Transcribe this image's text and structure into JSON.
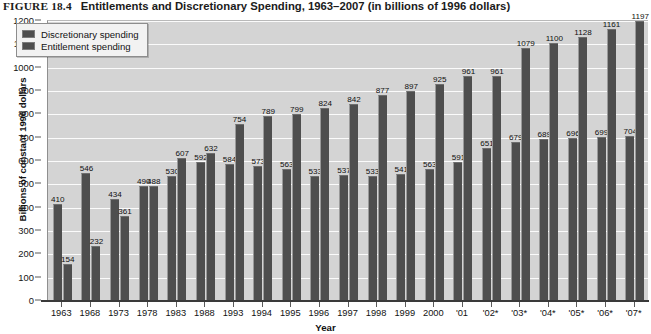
{
  "caption": {
    "figure_number": "FIGURE 18.4",
    "figure_title": "Entitlements and Discretionary Spending, 1963–2007 (in billions of 1996 dollars)"
  },
  "colors": {
    "plot_background": "#d4d4d4",
    "gridline": "#fbfbfb",
    "bar_fill": "#4e4e4e",
    "axis": "#3a3a3a",
    "legend_background": "#f2f2f2"
  },
  "chart_data": {
    "type": "bar",
    "title": "Entitlements and Discretionary Spending, 1963–2007 (in billions of 1996 dollars)",
    "xlabel": "Year",
    "ylabel": "Billions of constant 1996 dollars",
    "ylim": [
      0,
      1200
    ],
    "ytick_step": 100,
    "yticks": [
      0,
      100,
      200,
      300,
      400,
      500,
      600,
      700,
      800,
      900,
      1000,
      1100,
      1200
    ],
    "grid": true,
    "legend_position": "top-left",
    "categories": [
      "1963",
      "1968",
      "1973",
      "1978",
      "1983",
      "1988",
      "1993",
      "1994",
      "1995",
      "1996",
      "1997",
      "1998",
      "1999",
      "2000",
      "'01",
      "'02*",
      "'03*",
      "'04*",
      "'05*",
      "'06*",
      "'07*"
    ],
    "series": [
      {
        "name": "Discretionary spending",
        "values": [
          410,
          546,
          434,
          490,
          530,
          592,
          584,
          573,
          563,
          533,
          537,
          533,
          541,
          563,
          591,
          651,
          679,
          689,
          696,
          699,
          704
        ]
      },
      {
        "name": "Entitlement spending",
        "values": [
          154,
          232,
          361,
          488,
          607,
          632,
          754,
          789,
          799,
          824,
          842,
          877,
          897,
          925,
          961,
          961,
          1079,
          1100,
          1128,
          1161,
          1197
        ]
      }
    ]
  },
  "legend": {
    "items": [
      {
        "label": "Discretionary spending"
      },
      {
        "label": "Entitlement spending"
      }
    ]
  }
}
